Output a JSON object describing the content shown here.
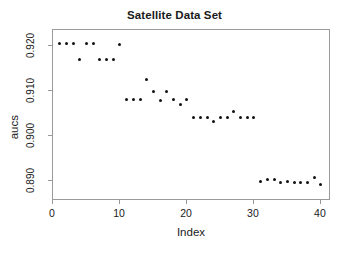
{
  "chart_data": {
    "type": "scatter",
    "title": "Satellite Data Set",
    "xlabel": "Index",
    "ylabel": "aucs",
    "xlim": [
      0,
      41.5
    ],
    "ylim": [
      0.8855,
      0.9235
    ],
    "grid": false,
    "legend": null,
    "xticks": [
      0,
      10,
      20,
      30,
      40
    ],
    "xtick_labels": [
      "0",
      "10",
      "20",
      "30",
      "40"
    ],
    "yticks": [
      0.89,
      0.9,
      0.91,
      0.92
    ],
    "ytick_labels": [
      "0.890",
      "0.900",
      "0.910",
      "0.920"
    ],
    "marker": "filled-circle",
    "marker_color": "#111111",
    "x": [
      1,
      2,
      3,
      4,
      5,
      6,
      7,
      8,
      9,
      10,
      11,
      12,
      13,
      14,
      15,
      16,
      17,
      18,
      19,
      20,
      21,
      22,
      23,
      24,
      25,
      26,
      27,
      28,
      29,
      30,
      31,
      32,
      33,
      34,
      35,
      36,
      37,
      38,
      39,
      40
    ],
    "y": [
      0.9205,
      0.9205,
      0.9205,
      0.917,
      0.9205,
      0.9205,
      0.917,
      0.917,
      0.917,
      0.9203,
      0.908,
      0.908,
      0.908,
      0.9125,
      0.9098,
      0.9079,
      0.9098,
      0.908,
      0.9069,
      0.908,
      0.904,
      0.904,
      0.904,
      0.9032,
      0.904,
      0.904,
      0.9053,
      0.904,
      0.904,
      0.904,
      0.8898,
      0.8903,
      0.8903,
      0.8896,
      0.8898,
      0.8896,
      0.8896,
      0.8896,
      0.8907,
      0.8891
    ]
  },
  "figure": {
    "background_color": "#ffffff",
    "frame_color": "#9a9a9a",
    "text_color": "#1a1a1a"
  }
}
